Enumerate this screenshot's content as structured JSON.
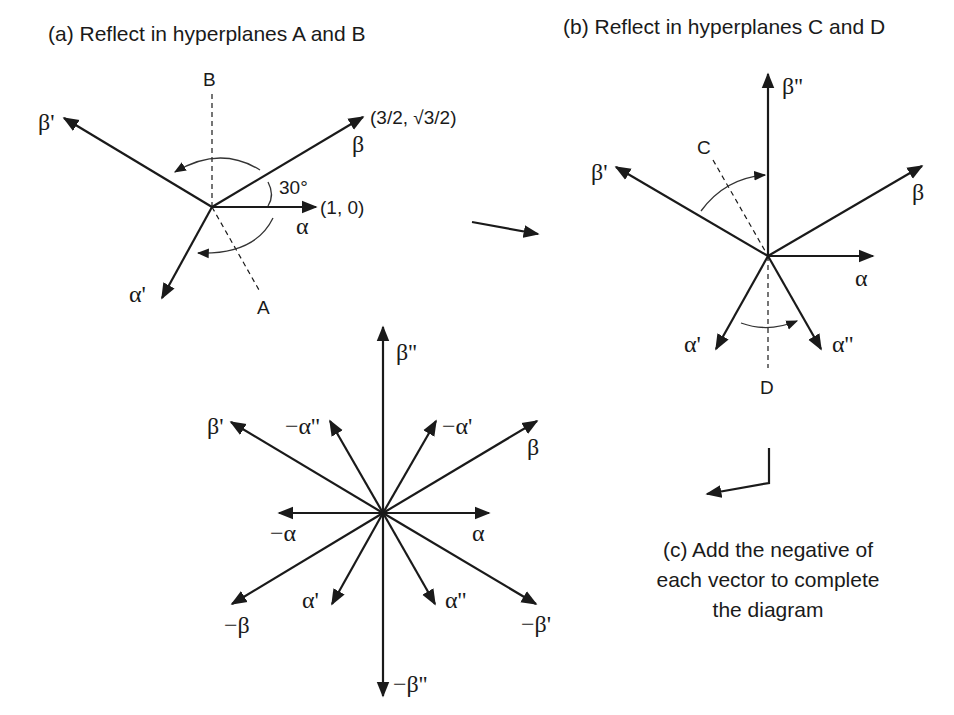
{
  "panels": {
    "a": {
      "title": "(a) Reflect in hyperplanes A and B",
      "hyperplanes": {
        "A": "A",
        "B": "B"
      },
      "vectors": {
        "alpha": "α",
        "beta": "β",
        "alpha_prime": "α'",
        "beta_prime": "β'"
      },
      "coords": {
        "alpha": "(1, 0)",
        "beta": "(3/2, √3/2)"
      },
      "angle": "30°"
    },
    "b": {
      "title": "(b) Reflect in hyperplanes C and D",
      "hyperplanes": {
        "C": "C",
        "D": "D"
      },
      "vectors": {
        "alpha": "α",
        "beta": "β",
        "alpha_prime": "α'",
        "beta_prime": "β'",
        "alpha_dprime": "α''",
        "beta_dprime": "β''"
      }
    },
    "c": {
      "caption_lines": [
        "(c) Add the negative of",
        "each vector to complete",
        "the diagram"
      ],
      "vectors": {
        "alpha": "α",
        "neg_alpha": "−α",
        "beta": "β",
        "neg_beta": "−β",
        "alpha_prime": "α'",
        "neg_alpha_prime": "−α'",
        "beta_prime": "β'",
        "neg_beta_prime": "−β'",
        "alpha_dprime": "α''",
        "neg_alpha_dprime": "−α''",
        "beta_dprime": "β''",
        "neg_beta_dprime": "−β''"
      }
    }
  },
  "colors": {
    "ink": "#1a1a1a",
    "background": "#ffffff"
  }
}
